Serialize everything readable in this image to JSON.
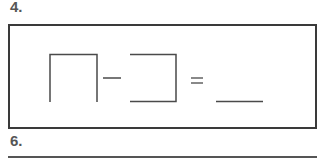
{
  "worksheet": {
    "problems": [
      {
        "number": "4.",
        "expression": {
          "operand_1": "open-bottom box shape",
          "operator_1": "−",
          "operand_2": "open-left box shape",
          "operator_2": "=",
          "answer": "blank"
        }
      },
      {
        "number": "6."
      }
    ],
    "colors": {
      "ink": "#3a3a3a",
      "heading": "#555555",
      "background": "#ffffff"
    }
  }
}
